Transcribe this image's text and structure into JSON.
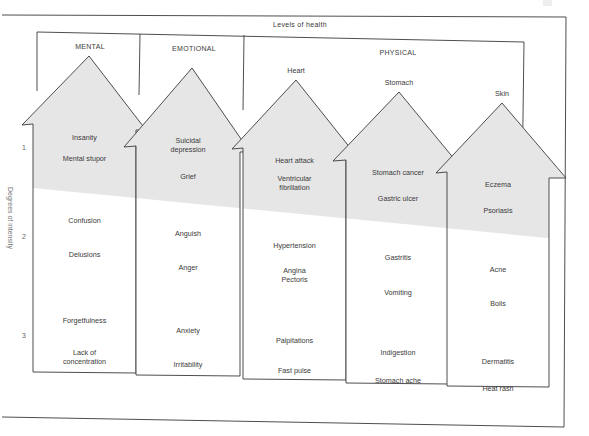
{
  "title": "Levels of health",
  "axis": {
    "title": "Degrees of intensity",
    "ticks": [
      "1",
      "2",
      "3"
    ]
  },
  "categories": {
    "mental": "MENTAL",
    "emotional": "EMOTIONAL",
    "physical": "PHYSICAL"
  },
  "colors": {
    "shade": "#e6e6e6",
    "line": "#3a3a3a",
    "text": "#3a3a3a"
  },
  "arrows": [
    {
      "id": "mental",
      "sublabel": "",
      "items": [
        [
          "Insanity"
        ],
        [
          "Mental stupor"
        ],
        [
          "Confusion"
        ],
        [
          "Delusions"
        ],
        [
          "Forgetfulness"
        ],
        [
          "Lack of",
          "concentration"
        ]
      ]
    },
    {
      "id": "emotional",
      "sublabel": "",
      "items": [
        [
          "Suicidal",
          "depression"
        ],
        [
          "Grief"
        ],
        [
          "Anguish"
        ],
        [
          "Anger"
        ],
        [
          "Anxiety"
        ],
        [
          "Irritability"
        ]
      ]
    },
    {
      "id": "heart",
      "sublabel": "Heart",
      "items": [
        [
          "Heart attack"
        ],
        [
          "Ventricular",
          "fibrillation"
        ],
        [
          "Hypertension"
        ],
        [
          "Angina",
          "Pectoris"
        ],
        [
          "Palpitations"
        ],
        [
          "Fast pulse"
        ]
      ]
    },
    {
      "id": "stomach",
      "sublabel": "Stomach",
      "items": [
        [
          "Stomach cancer"
        ],
        [
          "Gastric ulcer"
        ],
        [
          "Gastritis"
        ],
        [
          "Vomiting"
        ],
        [
          "Indigestion"
        ],
        [
          "Stomach ache"
        ]
      ]
    },
    {
      "id": "skin",
      "sublabel": "Skin",
      "items": [
        [
          "Eczema"
        ],
        [
          "Psoriasis"
        ],
        [
          "Acne"
        ],
        [
          "Boils"
        ],
        [
          "Dermatitis"
        ],
        [
          "Heat rash"
        ]
      ]
    }
  ]
}
